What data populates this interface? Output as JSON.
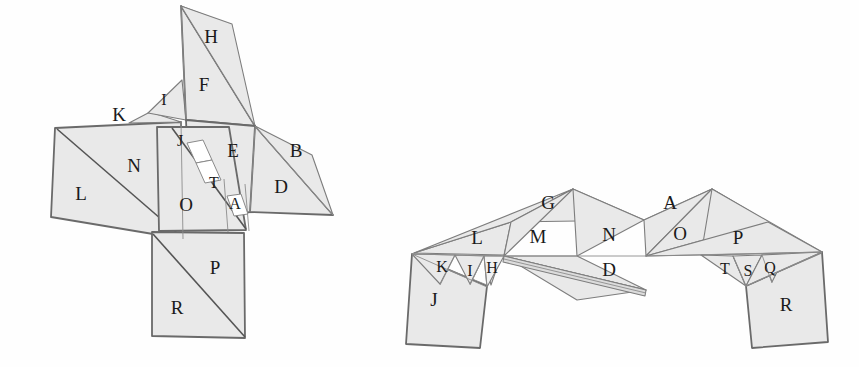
{
  "page": {
    "background_color": "#ffffff",
    "face_fill": "#e9e9e9",
    "face_stroke": "#7d7d7d",
    "label_color": "#1a1a1a",
    "width": 859,
    "height": 367
  },
  "figures": [
    {
      "id": "left-figure",
      "name": "left-net-diagram",
      "description": "Unfolded / partially folded polyhedron net, left diagram",
      "labels": [
        {
          "id": "H",
          "text": "H",
          "x": 211,
          "y": 39,
          "size": "normal"
        },
        {
          "id": "F",
          "text": "F",
          "x": 204,
          "y": 87,
          "size": "normal"
        },
        {
          "id": "I",
          "text": "I",
          "x": 164,
          "y": 101,
          "size": "small"
        },
        {
          "id": "K",
          "text": "K",
          "x": 119,
          "y": 117,
          "size": "normal"
        },
        {
          "id": "J",
          "text": "J",
          "x": 180,
          "y": 142,
          "size": "small"
        },
        {
          "id": "E",
          "text": "E",
          "x": 233,
          "y": 153,
          "size": "normal"
        },
        {
          "id": "B",
          "text": "B",
          "x": 296,
          "y": 153,
          "size": "normal"
        },
        {
          "id": "N",
          "text": "N",
          "x": 134,
          "y": 168,
          "size": "normal"
        },
        {
          "id": "T",
          "text": "T",
          "x": 214,
          "y": 184,
          "size": "small"
        },
        {
          "id": "D",
          "text": "D",
          "x": 281,
          "y": 189,
          "size": "normal"
        },
        {
          "id": "L",
          "text": "L",
          "x": 81,
          "y": 196,
          "size": "normal"
        },
        {
          "id": "O",
          "text": "O",
          "x": 186,
          "y": 207,
          "size": "normal"
        },
        {
          "id": "A",
          "text": "A",
          "x": 235,
          "y": 205,
          "size": "small"
        },
        {
          "id": "P",
          "text": "P",
          "x": 215,
          "y": 270,
          "size": "normal"
        },
        {
          "id": "R",
          "text": "R",
          "x": 177,
          "y": 310,
          "size": "normal"
        }
      ]
    },
    {
      "id": "right-figure",
      "name": "right-net-diagram",
      "description": "Partially folded polyhedron net, right diagram (zig-zag band with two wings)",
      "labels": [
        {
          "id": "G",
          "text": "G",
          "x": 548,
          "y": 205,
          "size": "normal"
        },
        {
          "id": "A",
          "text": "A",
          "x": 670,
          "y": 205,
          "size": "normal"
        },
        {
          "id": "L",
          "text": "L",
          "x": 477,
          "y": 240,
          "size": "normal"
        },
        {
          "id": "M",
          "text": "M",
          "x": 538,
          "y": 239,
          "size": "normal"
        },
        {
          "id": "N",
          "text": "N",
          "x": 609,
          "y": 237,
          "size": "normal"
        },
        {
          "id": "O",
          "text": "O",
          "x": 680,
          "y": 236,
          "size": "normal"
        },
        {
          "id": "P",
          "text": "P",
          "x": 738,
          "y": 240,
          "size": "normal"
        },
        {
          "id": "K",
          "text": "K",
          "x": 442,
          "y": 268,
          "size": "small"
        },
        {
          "id": "I",
          "text": "I",
          "x": 470,
          "y": 272,
          "size": "small"
        },
        {
          "id": "H",
          "text": "H",
          "x": 492,
          "y": 269,
          "size": "small"
        },
        {
          "id": "D",
          "text": "D",
          "x": 609,
          "y": 272,
          "size": "normal"
        },
        {
          "id": "T",
          "text": "T",
          "x": 725,
          "y": 270,
          "size": "small"
        },
        {
          "id": "S",
          "text": "S",
          "x": 748,
          "y": 272,
          "size": "small"
        },
        {
          "id": "Q",
          "text": "Q",
          "x": 770,
          "y": 269,
          "size": "small"
        },
        {
          "id": "J",
          "text": "J",
          "x": 434,
          "y": 302,
          "size": "normal"
        },
        {
          "id": "R",
          "text": "R",
          "x": 786,
          "y": 307,
          "size": "normal"
        }
      ]
    }
  ]
}
